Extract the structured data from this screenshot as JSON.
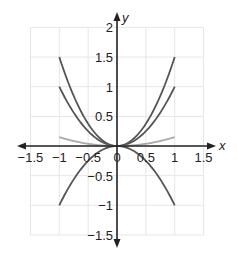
{
  "chart_data": {
    "type": "line",
    "title": "",
    "xlabel": "x",
    "ylabel": "y",
    "xlim": [
      -1.5,
      1.5
    ],
    "ylim": [
      -1.5,
      2
    ],
    "grid": true,
    "grid_step": 0.5,
    "x_ticks": [
      "-1.5",
      "-1",
      "-0.5",
      "0",
      "0.5",
      "1",
      "1.5"
    ],
    "y_ticks": [
      "2",
      "1.5",
      "1",
      "0.5",
      "-0.5",
      "-1",
      "-1.5"
    ],
    "series": [
      {
        "name": "y = 1.5x^2",
        "coef": 1.5,
        "domain": [
          -1,
          1
        ],
        "color": "#555555",
        "points": [
          [
            -1,
            1.5
          ],
          [
            -0.5,
            0.375
          ],
          [
            0,
            0
          ],
          [
            0.5,
            0.375
          ],
          [
            1,
            1.5
          ]
        ]
      },
      {
        "name": "y = x^2",
        "coef": 1,
        "domain": [
          -1,
          1
        ],
        "color": "#555555",
        "points": [
          [
            -1,
            1
          ],
          [
            -0.5,
            0.25
          ],
          [
            0,
            0
          ],
          [
            0.5,
            0.25
          ],
          [
            1,
            1
          ]
        ]
      },
      {
        "name": "y = 0.15x^2",
        "coef": 0.15,
        "domain": [
          -1,
          1
        ],
        "color": "#aaaaaa",
        "points": [
          [
            -1,
            0.15
          ],
          [
            -0.5,
            0.0375
          ],
          [
            0,
            0
          ],
          [
            0.5,
            0.0375
          ],
          [
            1,
            0.15
          ]
        ]
      },
      {
        "name": "y = -x^2",
        "coef": -1,
        "domain": [
          -1,
          1
        ],
        "color": "#555555",
        "points": [
          [
            -1,
            -1
          ],
          [
            -0.5,
            -0.25
          ],
          [
            0,
            0
          ],
          [
            0.5,
            -0.25
          ],
          [
            1,
            -1
          ]
        ]
      }
    ]
  }
}
